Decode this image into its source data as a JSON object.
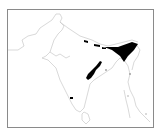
{
  "map": {
    "region": "Indian subcontinent",
    "frame_color": "#8a8a8a",
    "outline_color": "#c8c8c8",
    "fill_color": "#000000",
    "shaded_areas": [
      {
        "name": "northeast-range",
        "approx_center": [
          117,
          48
        ]
      },
      {
        "name": "himalaya-foothill-patches",
        "approx_center": [
          95,
          42
        ]
      },
      {
        "name": "eastern-ghats-patch",
        "approx_center": [
          94,
          69
        ]
      },
      {
        "name": "southern-india-point",
        "approx_center": [
          71,
          98
        ]
      }
    ]
  }
}
